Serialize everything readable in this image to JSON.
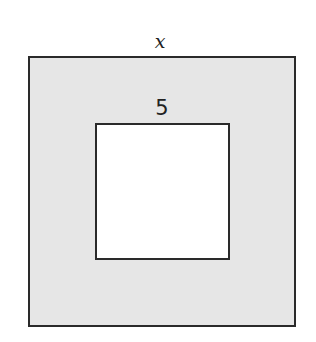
{
  "diagram": {
    "outer_square": {
      "side_label": "x",
      "fill": "#e6e6e6",
      "stroke": "#2a2a2a"
    },
    "inner_square": {
      "side_label": "5",
      "fill": "#ffffff",
      "stroke": "#2a2a2a"
    }
  }
}
